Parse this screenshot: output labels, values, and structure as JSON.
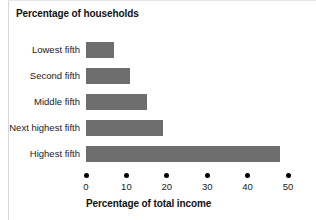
{
  "chart_data": {
    "type": "bar",
    "orientation": "horizontal",
    "title": "",
    "ylabel": "Percentage of households",
    "xlabel": "Percentage of total income",
    "categories": [
      "Lowest fifth",
      "Second fifth",
      "Middle fifth",
      "Next highest fifth",
      "Highest fifth"
    ],
    "values": [
      7,
      11,
      15,
      19,
      48
    ],
    "xlim": [
      0,
      50
    ],
    "xticks": [
      0,
      10,
      20,
      30,
      40,
      50
    ],
    "xtick_labels": [
      "0",
      "10",
      "20",
      "30",
      "40",
      "50"
    ],
    "grid": false,
    "legend": false,
    "bar_color": "#6e6e6e",
    "background_color": "#ffffff",
    "text_color": "#1a1a1a",
    "tick_marker": "filled-dot"
  }
}
